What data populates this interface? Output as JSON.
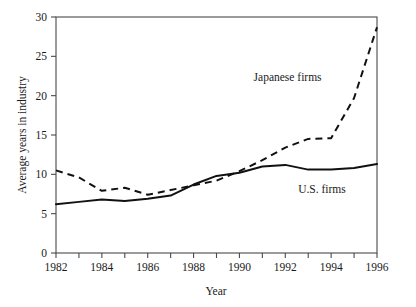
{
  "chart_data": {
    "type": "line",
    "title": "",
    "xlabel": "Year",
    "ylabel": "Average years in industry",
    "xlim": [
      1982,
      1996
    ],
    "ylim": [
      0,
      30
    ],
    "grid": false,
    "legend_position": "inline-annotations",
    "x": [
      1982,
      1983,
      1984,
      1985,
      1986,
      1987,
      1988,
      1989,
      1990,
      1991,
      1992,
      1993,
      1994,
      1995,
      1996
    ],
    "xticks": [
      1982,
      1983,
      1984,
      1985,
      1986,
      1987,
      1988,
      1989,
      1990,
      1991,
      1992,
      1993,
      1994,
      1995,
      1996
    ],
    "xtick_labels": [
      "1982",
      "",
      "1984",
      "",
      "1986",
      "",
      "1988",
      "",
      "1990",
      "",
      "1992",
      "",
      "1994",
      "",
      "1996"
    ],
    "yticks": [
      0,
      5,
      10,
      15,
      20,
      25,
      30
    ],
    "ytick_labels": [
      "0",
      "5",
      "10",
      "15",
      "20",
      "25",
      "30"
    ],
    "series": [
      {
        "name": "Japanese firms",
        "style": "dashed",
        "color": "#111111",
        "values": [
          10.5,
          9.6,
          7.9,
          8.3,
          7.4,
          8.0,
          8.6,
          9.2,
          10.4,
          11.8,
          13.4,
          14.5,
          14.6,
          19.7,
          28.7
        ]
      },
      {
        "name": "U.S. firms",
        "style": "solid",
        "color": "#111111",
        "values": [
          6.2,
          6.5,
          6.8,
          6.6,
          6.9,
          7.3,
          8.7,
          9.8,
          10.2,
          11.0,
          11.2,
          10.6,
          10.6,
          10.8,
          11.3
        ]
      }
    ],
    "annotations": [
      {
        "text": "Japanese firms",
        "x": 1992.1,
        "y": 21.9,
        "anchor": "middle"
      },
      {
        "text": "U.S. firms",
        "x": 1993.6,
        "y": 7.6,
        "anchor": "middle"
      }
    ]
  }
}
